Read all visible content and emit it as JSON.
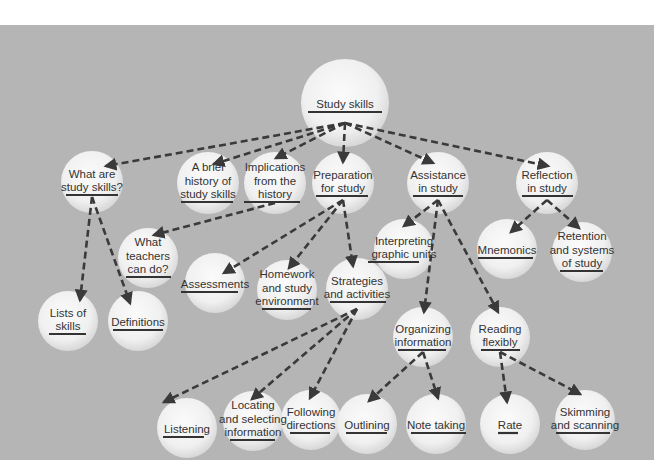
{
  "colors": {
    "page_background": "#ffffff",
    "panel_background": "#b5b5b5",
    "node_fill_center": "#fafafa",
    "node_fill_edge": "#dcdcdc",
    "text": "#333333",
    "underline": "#333333",
    "edge": "#3a3a3a"
  },
  "diagram": {
    "nodes": [
      {
        "id": "study-skills",
        "cx": 345,
        "cy": 103,
        "r": 44,
        "lines": [
          "Study skills"
        ],
        "underline": [
          308,
          382
        ]
      },
      {
        "id": "what-are-study-skills",
        "cx": 92,
        "cy": 182,
        "r": 31,
        "lines": [
          "What are",
          "study skills?"
        ],
        "underline": [
          66,
          118
        ]
      },
      {
        "id": "brief-history",
        "cx": 208,
        "cy": 183,
        "r": 31,
        "lines": [
          "A brief",
          "history of",
          "study skills"
        ],
        "underline": [
          181,
          233
        ]
      },
      {
        "id": "implications-from-history",
        "cx": 275,
        "cy": 183,
        "r": 31,
        "lines": [
          "Implications",
          "from the",
          "history"
        ],
        "underline": [
          244,
          300
        ]
      },
      {
        "id": "preparation-for-study",
        "cx": 343,
        "cy": 183,
        "r": 31,
        "lines": [
          "Preparation",
          "for study"
        ],
        "underline": [
          316,
          368
        ]
      },
      {
        "id": "assistance-in-study",
        "cx": 438,
        "cy": 183,
        "r": 31,
        "lines": [
          "Assistance",
          "in study"
        ],
        "underline": [
          413,
          463
        ]
      },
      {
        "id": "reflection-in-study",
        "cx": 547,
        "cy": 183,
        "r": 31,
        "lines": [
          "Reflection",
          "in study"
        ],
        "underline": [
          522,
          573
        ]
      },
      {
        "id": "what-teachers-can-do",
        "cx": 148,
        "cy": 258,
        "r": 30,
        "lines": [
          "What",
          "teachers",
          "can do?"
        ],
        "underline": [
          126,
          171
        ]
      },
      {
        "id": "interpreting-graphic-units",
        "cx": 404,
        "cy": 249,
        "r": 30,
        "lines": [
          "Interpreting",
          "graphic units"
        ],
        "underline": [
          368,
          419
        ]
      },
      {
        "id": "mnemonics",
        "cx": 507,
        "cy": 249,
        "r": 30,
        "lines": [
          "Mnemonics"
        ],
        "underline": [
          478,
          533
        ]
      },
      {
        "id": "retention-and-systems",
        "cx": 582,
        "cy": 252,
        "r": 30,
        "lines": [
          "Retention",
          "and systems",
          "of study"
        ],
        "underline": [
          560,
          603
        ]
      },
      {
        "id": "lists-of-skills",
        "cx": 68,
        "cy": 321,
        "r": 30,
        "lines": [
          "Lists of",
          "skills"
        ],
        "underline": [
          49,
          86
        ]
      },
      {
        "id": "definitions",
        "cx": 138,
        "cy": 321,
        "r": 30,
        "lines": [
          "Definitions"
        ],
        "underline": [
          113,
          163
        ]
      },
      {
        "id": "assessments",
        "cx": 215,
        "cy": 283,
        "r": 30,
        "lines": [
          "Assessments"
        ],
        "underline": [
          181,
          238
        ]
      },
      {
        "id": "homework-environment",
        "cx": 287,
        "cy": 290,
        "r": 30,
        "lines": [
          "Homework",
          "and study",
          "environment"
        ],
        "underline": [
          262,
          311
        ]
      },
      {
        "id": "strategies-and-activities",
        "cx": 357,
        "cy": 289,
        "r": 31,
        "lines": [
          "Strategies",
          "and activities"
        ],
        "underline": [
          330,
          386
        ]
      },
      {
        "id": "organizing-information",
        "cx": 423,
        "cy": 337,
        "r": 30,
        "lines": [
          "Organizing",
          "information"
        ],
        "underline": [
          398,
          446
        ]
      },
      {
        "id": "reading-flexibly",
        "cx": 500,
        "cy": 337,
        "r": 30,
        "lines": [
          "Reading",
          "flexibly"
        ],
        "underline": [
          481,
          520
        ]
      },
      {
        "id": "listening",
        "cx": 187,
        "cy": 428,
        "r": 30,
        "lines": [
          "Listening"
        ],
        "underline": [
          163,
          204
        ]
      },
      {
        "id": "locating-selecting",
        "cx": 253,
        "cy": 421,
        "r": 30,
        "lines": [
          "Locating",
          "and selecting",
          "information"
        ],
        "underline": [
          230,
          275
        ]
      },
      {
        "id": "following-directions",
        "cx": 311,
        "cy": 420,
        "r": 30,
        "lines": [
          "Following",
          "directions"
        ],
        "underline": [
          290,
          330
        ]
      },
      {
        "id": "outlining",
        "cx": 367,
        "cy": 424,
        "r": 30,
        "lines": [
          "Outlining"
        ],
        "underline": [
          346,
          387
        ]
      },
      {
        "id": "note-taking",
        "cx": 436,
        "cy": 424,
        "r": 30,
        "lines": [
          "Note taking"
        ],
        "underline": [
          411,
          466
        ]
      },
      {
        "id": "rate",
        "cx": 510,
        "cy": 424,
        "r": 30,
        "lines": [
          "Rate"
        ],
        "underline": [
          498,
          518
        ]
      },
      {
        "id": "skimming-scanning",
        "cx": 585,
        "cy": 420,
        "r": 30,
        "lines": [
          "Skimming",
          "and scanning"
        ],
        "underline": [
          556,
          610
        ]
      }
    ],
    "edges": [
      {
        "from": [
          345,
          123
        ],
        "to": [
          106,
          166
        ]
      },
      {
        "from": [
          345,
          123
        ],
        "to": [
          214,
          164
        ]
      },
      {
        "from": [
          345,
          123
        ],
        "to": [
          276,
          158
        ]
      },
      {
        "from": [
          345,
          123
        ],
        "to": [
          343,
          162
        ]
      },
      {
        "from": [
          345,
          123
        ],
        "to": [
          433,
          163
        ]
      },
      {
        "from": [
          345,
          123
        ],
        "to": [
          548,
          166
        ]
      },
      {
        "from": [
          92,
          197
        ],
        "to": [
          80,
          300
        ]
      },
      {
        "from": [
          92,
          197
        ],
        "to": [
          130,
          303
        ]
      },
      {
        "from": [
          275,
          203
        ],
        "to": [
          154,
          235
        ]
      },
      {
        "from": [
          343,
          200
        ],
        "to": [
          224,
          273
        ]
      },
      {
        "from": [
          343,
          200
        ],
        "to": [
          289,
          268
        ]
      },
      {
        "from": [
          343,
          200
        ],
        "to": [
          353,
          266
        ]
      },
      {
        "from": [
          438,
          200
        ],
        "to": [
          404,
          226
        ]
      },
      {
        "from": [
          438,
          200
        ],
        "to": [
          424,
          312
        ]
      },
      {
        "from": [
          438,
          200
        ],
        "to": [
          498,
          312
        ]
      },
      {
        "from": [
          547,
          200
        ],
        "to": [
          511,
          232
        ]
      },
      {
        "from": [
          547,
          200
        ],
        "to": [
          579,
          228
        ]
      },
      {
        "from": [
          357,
          309
        ],
        "to": [
          164,
          402
        ]
      },
      {
        "from": [
          357,
          309
        ],
        "to": [
          252,
          399
        ]
      },
      {
        "from": [
          357,
          309
        ],
        "to": [
          310,
          398
        ]
      },
      {
        "from": [
          423,
          352
        ],
        "to": [
          369,
          401
        ]
      },
      {
        "from": [
          423,
          352
        ],
        "to": [
          438,
          398
        ]
      },
      {
        "from": [
          500,
          352
        ],
        "to": [
          507,
          402
        ]
      },
      {
        "from": [
          500,
          352
        ],
        "to": [
          580,
          394
        ]
      }
    ]
  }
}
